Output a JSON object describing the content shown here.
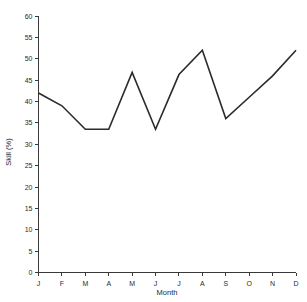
{
  "chart_data": {
    "type": "line",
    "title": "",
    "xlabel": "Month",
    "ylabel": "Skill (%)",
    "categories": [
      "J",
      "F",
      "M",
      "A",
      "M",
      "J",
      "J",
      "A",
      "S",
      "O",
      "N",
      "D"
    ],
    "category_names": [
      "January",
      "February",
      "March",
      "April",
      "May",
      "June",
      "July",
      "August",
      "September",
      "October",
      "November",
      "December"
    ],
    "values": [
      42,
      39,
      33.5,
      33.5,
      46.8,
      33.5,
      46.3,
      52,
      36,
      41,
      46,
      52
    ],
    "series": [
      {
        "name": "Skill",
        "values": [
          42,
          39,
          33.5,
          33.5,
          46.8,
          33.5,
          46.3,
          52,
          36,
          41,
          46,
          52
        ]
      }
    ],
    "ylim": [
      0,
      60
    ],
    "ytick_step": 5,
    "yticks": [
      0,
      5,
      10,
      15,
      20,
      25,
      30,
      35,
      40,
      45,
      50,
      55,
      60
    ],
    "ytick_labels": [
      "0",
      "5",
      "10",
      "15",
      "20",
      "25",
      "30",
      "35",
      "40",
      "45",
      "50",
      "55",
      "60"
    ],
    "grid": false,
    "legend": "none",
    "line_color": "#2b2b2b",
    "axis_color": "#3a3a3a",
    "background": "#ffffff"
  }
}
